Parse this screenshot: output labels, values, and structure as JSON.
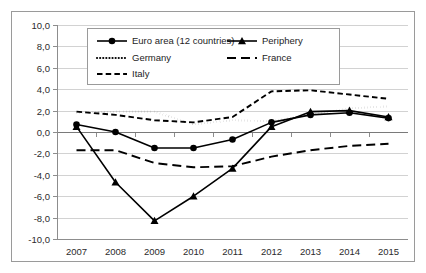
{
  "chart_data": {
    "type": "line",
    "title": "",
    "subtitle": "",
    "xlabel": "",
    "ylabel": "",
    "categories": [
      "2007",
      "2008",
      "2009",
      "2010",
      "2011",
      "2012",
      "2013",
      "2014",
      "2015"
    ],
    "x": [
      2007,
      2008,
      2009,
      2010,
      2011,
      2012,
      2013,
      2014,
      2015
    ],
    "ylim": [
      -10.0,
      10.0
    ],
    "ytick_labels": [
      "10,0",
      "8,0",
      "6,0",
      "4,0",
      "2,0",
      "0,0",
      "-2,0",
      "-4,0",
      "-6,0",
      "-8,0",
      "-10,0"
    ],
    "ytick_values": [
      10.0,
      8.0,
      6.0,
      4.0,
      2.0,
      0.0,
      -2.0,
      -4.0,
      -6.0,
      -8.0,
      -10.0
    ],
    "grid": true,
    "grid_axis": "y",
    "legend_position": "top-center",
    "decimal_separator": ",",
    "series": [
      {
        "name": "Euro area (12 countries)",
        "style": "solid-marker-circle",
        "marker": "circle",
        "color": "#000000",
        "values": [
          0.7,
          0.0,
          -1.5,
          -1.5,
          -0.7,
          0.9,
          1.6,
          1.8,
          1.3
        ]
      },
      {
        "name": "Periphery",
        "style": "solid-marker-triangle",
        "marker": "triangle",
        "color": "#000000",
        "values": [
          0.5,
          -4.7,
          -8.3,
          -6.0,
          -3.4,
          0.5,
          1.9,
          2.0,
          1.4
        ]
      },
      {
        "name": "Germany",
        "style": "dotted",
        "marker": "none",
        "color": "#000000",
        "values": [
          1.8,
          1.9,
          1.9,
          0.7,
          1.1,
          1.0,
          1.6,
          2.2,
          2.4
        ]
      },
      {
        "name": "France",
        "style": "long-dash",
        "marker": "none",
        "color": "#000000",
        "values": [
          -1.7,
          -1.7,
          -2.9,
          -3.3,
          -3.2,
          -2.3,
          -1.7,
          -1.3,
          -1.1
        ]
      },
      {
        "name": "Italy",
        "style": "short-dash",
        "marker": "none",
        "color": "#000000",
        "values": [
          1.9,
          1.6,
          1.1,
          0.9,
          1.4,
          3.8,
          3.9,
          3.5,
          3.1
        ]
      }
    ]
  },
  "legend": {
    "entries": [
      {
        "label": "Euro area (12 countries)",
        "style": "solid-marker-circle",
        "column": 0,
        "row": 0
      },
      {
        "label": "Periphery",
        "style": "solid-marker-triangle",
        "column": 1,
        "row": 0
      },
      {
        "label": "Germany",
        "style": "dotted",
        "column": 0,
        "row": 1
      },
      {
        "label": "France",
        "style": "long-dash",
        "column": 1,
        "row": 1
      },
      {
        "label": "Italy",
        "style": "short-dash",
        "column": 0,
        "row": 2
      }
    ]
  }
}
